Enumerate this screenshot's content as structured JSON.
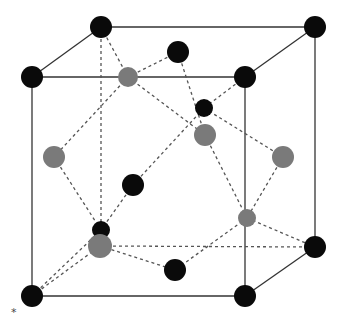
{
  "diagram": {
    "type": "crystal-unit-cell",
    "annotation": "*",
    "colors": {
      "corner_atom": "#0a0a0a",
      "inner_atom": "#0a0a0a",
      "face_atom": "#7a7a7a",
      "edge": "#333333",
      "bond": "#555555"
    },
    "cube": {
      "front": [
        [
          32,
          77
        ],
        [
          245,
          77
        ],
        [
          245,
          296
        ],
        [
          32,
          296
        ]
      ],
      "back": [
        [
          101,
          27
        ],
        [
          315,
          27
        ],
        [
          315,
          247
        ],
        [
          101,
          247
        ]
      ]
    },
    "atoms": [
      {
        "id": "c1",
        "x": 101,
        "y": 27,
        "r": 11,
        "kind": "corner"
      },
      {
        "id": "c2",
        "x": 315,
        "y": 27,
        "r": 11,
        "kind": "corner"
      },
      {
        "id": "c3",
        "x": 32,
        "y": 77,
        "r": 11,
        "kind": "corner"
      },
      {
        "id": "c4",
        "x": 245,
        "y": 77,
        "r": 11,
        "kind": "corner"
      },
      {
        "id": "c5",
        "x": 315,
        "y": 247,
        "r": 11,
        "kind": "corner"
      },
      {
        "id": "c6",
        "x": 32,
        "y": 296,
        "r": 11,
        "kind": "corner"
      },
      {
        "id": "c7",
        "x": 245,
        "y": 296,
        "r": 11,
        "kind": "corner"
      },
      {
        "id": "i1",
        "x": 178,
        "y": 52,
        "r": 11,
        "kind": "inner"
      },
      {
        "id": "i2",
        "x": 204,
        "y": 108,
        "r": 9,
        "kind": "inner"
      },
      {
        "id": "i3",
        "x": 133,
        "y": 185,
        "r": 11,
        "kind": "inner"
      },
      {
        "id": "i4",
        "x": 101,
        "y": 230,
        "r": 9,
        "kind": "inner"
      },
      {
        "id": "i5",
        "x": 175,
        "y": 270,
        "r": 11,
        "kind": "inner"
      },
      {
        "id": "f1",
        "x": 128,
        "y": 77,
        "r": 10,
        "kind": "face"
      },
      {
        "id": "f2",
        "x": 205,
        "y": 135,
        "r": 11,
        "kind": "face"
      },
      {
        "id": "f3",
        "x": 283,
        "y": 157,
        "r": 11,
        "kind": "face"
      },
      {
        "id": "f4",
        "x": 54,
        "y": 157,
        "r": 11,
        "kind": "face"
      },
      {
        "id": "f5",
        "x": 247,
        "y": 218,
        "r": 9,
        "kind": "face"
      },
      {
        "id": "f6",
        "x": 100,
        "y": 246,
        "r": 12,
        "kind": "face"
      }
    ]
  }
}
